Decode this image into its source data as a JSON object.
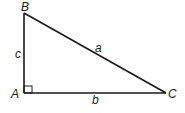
{
  "diagram": {
    "type": "right-triangle",
    "vertices": {
      "A": {
        "label": "A",
        "right_angle": true
      },
      "B": {
        "label": "B"
      },
      "C": {
        "label": "C"
      }
    },
    "sides": {
      "a": {
        "label": "a",
        "opposite": "A",
        "between": [
          "B",
          "C"
        ]
      },
      "b": {
        "label": "b",
        "opposite": "B",
        "between": [
          "A",
          "C"
        ]
      },
      "c": {
        "label": "c",
        "opposite": "C",
        "between": [
          "A",
          "B"
        ]
      }
    },
    "colors": {
      "line": "#1a1a1a",
      "background": "#ffffff"
    }
  }
}
